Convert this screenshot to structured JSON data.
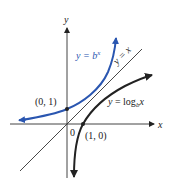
{
  "diagram": {
    "type": "function-graph",
    "axes": {
      "x_label": "x",
      "y_label": "y",
      "origin_label": "0"
    },
    "curves": [
      {
        "name": "exponential",
        "label": "y = b",
        "label_sup": "x",
        "color": "#2a56b0"
      },
      {
        "name": "logarithm",
        "label": "y = log",
        "label_sub": "b",
        "label_tail": "x",
        "color": "#222222"
      },
      {
        "name": "identity",
        "label": "y = x",
        "color": "#222222"
      }
    ],
    "points": [
      {
        "label": "(0, 1)"
      },
      {
        "label": "(1, 0)"
      }
    ]
  }
}
